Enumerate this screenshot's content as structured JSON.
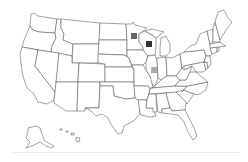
{
  "map": {
    "title": "",
    "region": "United States",
    "outline_color": "#555555",
    "fill_color": "#ffffff",
    "background": "#ffffff"
  },
  "markers": [
    {
      "state": "Minnesota",
      "abbr": "MN",
      "color": "#666666",
      "x": 131,
      "y": 33,
      "size": 6
    },
    {
      "state": "Wisconsin",
      "abbr": "WI",
      "color": "#333333",
      "x": 146,
      "y": 41,
      "size": 6
    },
    {
      "state": "Illinois",
      "abbr": "IL",
      "color": "#aaaaaa",
      "x": 151,
      "y": 67,
      "size": 6
    }
  ],
  "footer": {
    "divider_color": "#ececec"
  }
}
